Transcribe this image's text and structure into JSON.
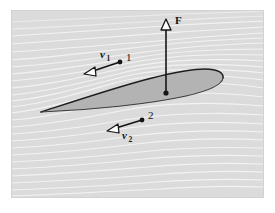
{
  "figure": {
    "canvas": {
      "width": 275,
      "height": 213
    },
    "frame": {
      "x": 11,
      "y": 10,
      "width": 253,
      "height": 188,
      "background_color": "#dcdcdc",
      "page_color": "#ffffff"
    }
  },
  "airfoil": {
    "name": "airfoil-cross-section",
    "fill_color": "#b3b3b3",
    "outline_color": "#1a1a1a",
    "leading_tip": "right",
    "trailing_tip": "left"
  },
  "streamlines": {
    "name": "flow-streamlines",
    "line_color": "#f2f2f2",
    "count": 26,
    "description": "airflow streamlines over and under the airfoil"
  },
  "annotations": {
    "force": {
      "label": "F",
      "name": "lift-force-vector",
      "direction": "up",
      "color": "#111111",
      "anchor_point": {
        "x": 166,
        "y": 93
      },
      "tip_point": {
        "x": 166,
        "y": 22
      }
    },
    "velocity_top": {
      "label": "v",
      "subscript": "1",
      "point_label": "1",
      "name": "velocity-vector-upper",
      "direction": "left",
      "color": "#111111",
      "anchor_point": {
        "x": 120,
        "y": 62
      },
      "tip_point": {
        "x": 88,
        "y": 73
      }
    },
    "velocity_bottom": {
      "label": "v",
      "subscript": "2",
      "point_label": "2",
      "name": "velocity-vector-lower",
      "direction": "left",
      "color": "#111111",
      "anchor_point": {
        "x": 142,
        "y": 120
      },
      "tip_point": {
        "x": 110,
        "y": 130
      }
    }
  }
}
